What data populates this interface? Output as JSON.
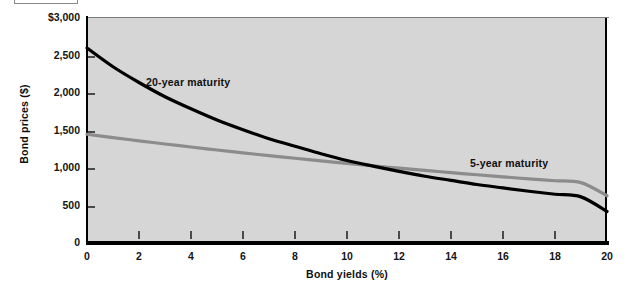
{
  "figure": {
    "background": "#ffffff",
    "plot_background": "#d6d6d6",
    "axis_color": "#000000"
  },
  "chart_data": {
    "type": "line",
    "title": "",
    "xlabel": "Bond yields (%)",
    "ylabel": "Bond prices ($)",
    "xlim": [
      0,
      20
    ],
    "ylim": [
      0,
      3000
    ],
    "grid": false,
    "legend_position": "inline-annotations",
    "xticks": [
      "0",
      "2",
      "4",
      "6",
      "8",
      "10",
      "12",
      "14",
      "16",
      "18",
      "20"
    ],
    "xtick_values": [
      0,
      2,
      4,
      6,
      8,
      10,
      12,
      14,
      16,
      18,
      20
    ],
    "yticks": [
      "0",
      "500",
      "1,000",
      "1,500",
      "2,000",
      "2,500",
      "$3,000"
    ],
    "ytick_values": [
      0,
      500,
      1000,
      1500,
      2000,
      2500,
      3000
    ],
    "x": [
      0,
      1,
      2,
      3,
      4,
      5,
      6,
      7,
      8,
      9,
      10,
      11,
      12,
      13,
      14,
      15,
      16,
      17,
      18,
      19,
      20
    ],
    "series": [
      {
        "name": "20-year maturity",
        "label": "20-year maturity",
        "color": "#000000",
        "width": 3.2,
        "values": [
          2600,
          2350,
          2140,
          1950,
          1790,
          1640,
          1510,
          1390,
          1290,
          1190,
          1100,
          1025,
          955,
          890,
          835,
          780,
          735,
          690,
          650,
          615,
          420
        ]
      },
      {
        "name": "5-year maturity",
        "label": "5-year maturity",
        "color": "#8c8c8c",
        "width": 3.2,
        "values": [
          1450,
          1405,
          1362,
          1320,
          1280,
          1240,
          1202,
          1165,
          1130,
          1095,
          1062,
          1030,
          998,
          968,
          938,
          910,
          882,
          855,
          830,
          805,
          630
        ]
      }
    ],
    "annotations": [
      {
        "text": "20-year maturity",
        "x": 2.4,
        "y": 2050
      },
      {
        "text": "5-year maturity",
        "x": 14.8,
        "y": 855
      }
    ]
  }
}
